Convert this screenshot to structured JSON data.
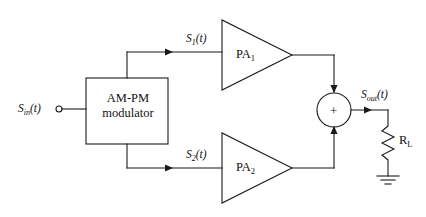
{
  "diagram": {
    "type": "block-diagram",
    "canvas": {
      "width": 426,
      "height": 217
    },
    "stroke_color": "#1a1a1a",
    "background_color": "#ffffff"
  },
  "signals": {
    "input": {
      "base": "S",
      "sub": "in",
      "arg": "(t)",
      "full": "S_in(t)"
    },
    "branch_top": {
      "base": "S",
      "sub": "1",
      "arg": "(t)",
      "full": "S_1(t)"
    },
    "branch_bottom": {
      "base": "S",
      "sub": "2",
      "arg": "(t)",
      "full": "S_2(t)"
    },
    "output": {
      "base": "S",
      "sub": "out",
      "arg": "(t)",
      "full": "S_out(t)"
    }
  },
  "blocks": {
    "modulator": {
      "label_line1": "AM-PM",
      "label_line2": "modulator",
      "shape": "rectangle"
    },
    "amplifier_top": {
      "base": "PA",
      "sub": "1",
      "full": "PA1",
      "shape": "triangle"
    },
    "amplifier_bottom": {
      "base": "PA",
      "sub": "2",
      "full": "PA2",
      "shape": "triangle"
    },
    "summer": {
      "label": "+",
      "shape": "circle"
    },
    "load": {
      "base": "R",
      "sub": "L",
      "full": "RL",
      "shape": "resistor-zigzag"
    },
    "ground": {
      "label": "",
      "shape": "earth-ground"
    }
  },
  "connections": [
    {
      "from": "input-terminal",
      "to": "modulator"
    },
    {
      "from": "modulator",
      "to": "amplifier_top",
      "signal": "S_1(t)"
    },
    {
      "from": "modulator",
      "to": "amplifier_bottom",
      "signal": "S_2(t)"
    },
    {
      "from": "amplifier_top",
      "to": "summer"
    },
    {
      "from": "amplifier_bottom",
      "to": "summer"
    },
    {
      "from": "summer",
      "to": "load",
      "signal": "S_out(t)"
    },
    {
      "from": "load",
      "to": "ground"
    }
  ]
}
